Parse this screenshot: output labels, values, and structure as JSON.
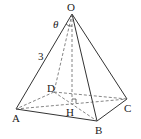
{
  "diagram": {
    "type": "square pyramid",
    "points": {
      "O": {
        "label": "O",
        "x": 72,
        "y": 14
      },
      "A": {
        "label": "A",
        "x": 16,
        "y": 109
      },
      "B": {
        "label": "B",
        "x": 97,
        "y": 121
      },
      "C": {
        "label": "C",
        "x": 127,
        "y": 99
      },
      "D": {
        "label": "D",
        "x": 54,
        "y": 92
      },
      "H": {
        "label": "H",
        "x": 72,
        "y": 104
      }
    },
    "edge_label": "3",
    "angle_label": "θ",
    "colors": {
      "line": "#333333",
      "dashed": "#666666"
    }
  }
}
